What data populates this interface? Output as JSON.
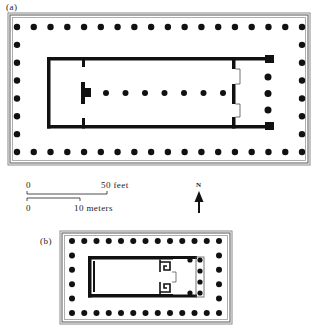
{
  "figure": {
    "plan_a": {
      "label": "(a)",
      "peristyle": {
        "front_columns": 18,
        "side_columns": 8
      },
      "interior_row_columns": 7,
      "porch_columns": 3
    },
    "plan_b": {
      "label": "(b)",
      "peristyle": {
        "front_columns": 13,
        "side_columns": 6
      },
      "porch_columns": 4
    },
    "scale": {
      "feet_zero": "0",
      "feet_end": "50 feet",
      "meters_zero": "0",
      "meters_end": "10 meters"
    },
    "north_arrow": {
      "label": "N"
    },
    "colors": {
      "ink": "#111111",
      "frame": "#777777",
      "background": "#ffffff"
    }
  }
}
